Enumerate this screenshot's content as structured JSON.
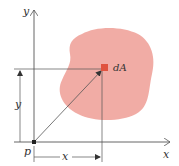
{
  "figure": {
    "labels": {
      "y_axis": "y",
      "x_axis": "x",
      "origin": "p",
      "element": "dA",
      "x_dimension": "x",
      "y_dimension": "y"
    },
    "colors": {
      "region_fill": "#f0a8a0",
      "element_fill": "#e0533f",
      "line": "#555555",
      "text": "#333333"
    }
  }
}
